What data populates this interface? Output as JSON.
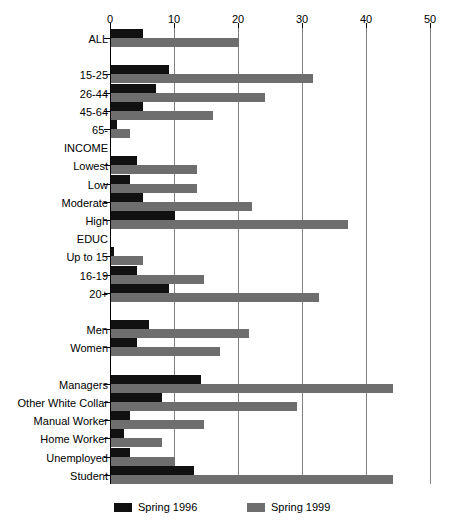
{
  "chart_data": {
    "type": "bar",
    "orientation": "horizontal",
    "title": "",
    "subtitle": "",
    "xlabel": "",
    "ylabel": "",
    "xlim": [
      0,
      50
    ],
    "xticks": [
      0,
      10,
      20,
      30,
      40,
      50
    ],
    "xtick_labels": [
      "0",
      "10",
      "20",
      "30",
      "40",
      "50"
    ],
    "grid": true,
    "grid_axis": "x",
    "legend_position": "bottom",
    "colors": {
      "spring_1996": "#111111",
      "spring_1999": "#6e6e6e",
      "gridline": "#808080",
      "axis": "#000000",
      "background": "#ffffff"
    },
    "legend": [
      {
        "name": "Spring 1996",
        "color": "#111111"
      },
      {
        "name": "Spring 1999",
        "color": "#6e6e6e"
      }
    ],
    "series": [
      {
        "name": "Spring 1996",
        "color": "#111111"
      },
      {
        "name": "Spring 1999",
        "color": "#6e6e6e"
      }
    ],
    "categories": [
      "ALL",
      "",
      "15-25",
      "26-44",
      "45-64",
      "65-",
      "INCOME",
      "Lowest",
      "Low",
      "Moderate",
      "High",
      "EDUC",
      "Up to 15",
      "16-19",
      "20+",
      "",
      "Men",
      "Women",
      "",
      "Managers",
      "Other White Collar",
      "Manual Worker",
      "Home Worker",
      "Unemployed",
      "Student"
    ],
    "rows": [
      {
        "label": "ALL",
        "type": "data",
        "spring_1996": 5,
        "spring_1999": 20
      },
      {
        "label": "",
        "type": "spacer",
        "spring_1996": null,
        "spring_1999": null
      },
      {
        "label": "15-25",
        "type": "data",
        "spring_1996": 9,
        "spring_1999": 31.5
      },
      {
        "label": "26-44",
        "type": "data",
        "spring_1996": 7,
        "spring_1999": 24
      },
      {
        "label": "45-64",
        "type": "data",
        "spring_1996": 5,
        "spring_1999": 16
      },
      {
        "label": "65-",
        "type": "data",
        "spring_1996": 1,
        "spring_1999": 3
      },
      {
        "label": "INCOME",
        "type": "header",
        "spring_1996": null,
        "spring_1999": null
      },
      {
        "label": "Lowest",
        "type": "data",
        "spring_1996": 4,
        "spring_1999": 13.5
      },
      {
        "label": "Low",
        "type": "data",
        "spring_1996": 3,
        "spring_1999": 13.5
      },
      {
        "label": "Moderate",
        "type": "data",
        "spring_1996": 5,
        "spring_1999": 22
      },
      {
        "label": "High",
        "type": "data",
        "spring_1996": 10,
        "spring_1999": 37
      },
      {
        "label": "EDUC",
        "type": "header",
        "spring_1996": null,
        "spring_1999": null
      },
      {
        "label": "Up to 15",
        "type": "data",
        "spring_1996": 0.5,
        "spring_1999": 5
      },
      {
        "label": "16-19",
        "type": "data",
        "spring_1996": 4,
        "spring_1999": 14.5
      },
      {
        "label": "20+",
        "type": "data",
        "spring_1996": 9,
        "spring_1999": 32.5
      },
      {
        "label": "",
        "type": "spacer",
        "spring_1996": null,
        "spring_1999": null
      },
      {
        "label": "Men",
        "type": "data",
        "spring_1996": 6,
        "spring_1999": 21.5
      },
      {
        "label": "Women",
        "type": "data",
        "spring_1996": 4,
        "spring_1999": 17
      },
      {
        "label": "",
        "type": "spacer",
        "spring_1996": null,
        "spring_1999": null
      },
      {
        "label": "Managers",
        "type": "data",
        "spring_1996": 14,
        "spring_1999": 44
      },
      {
        "label": "Other White Collar",
        "type": "data",
        "spring_1996": 8,
        "spring_1999": 29
      },
      {
        "label": "Manual Worker",
        "type": "data",
        "spring_1996": 3,
        "spring_1999": 14.5
      },
      {
        "label": "Home Worker",
        "type": "data",
        "spring_1996": 2,
        "spring_1999": 8
      },
      {
        "label": "Unemployed",
        "type": "data",
        "spring_1996": 3,
        "spring_1999": 10
      },
      {
        "label": "Student",
        "type": "data",
        "spring_1996": 13,
        "spring_1999": 44
      }
    ]
  }
}
